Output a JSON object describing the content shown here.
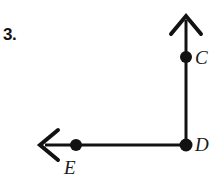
{
  "figure": {
    "problem_number": "3.",
    "stroke_color": "#121212",
    "background_color": "#ffffff",
    "labels": {
      "C": "C",
      "D": "D",
      "E": "E"
    },
    "points": [
      {
        "name": "C",
        "label": "C",
        "x": 186,
        "y": 57,
        "dot_radius": 6
      },
      {
        "name": "D",
        "label": "D",
        "x": 186,
        "y": 145,
        "dot_radius": 6
      },
      {
        "name": "E",
        "label": "E",
        "x": 76,
        "y": 145,
        "dot_radius": 6
      }
    ],
    "rays": [
      {
        "name": "ray-DC-up",
        "from": {
          "x": 186,
          "y": 145
        },
        "to": {
          "x": 186,
          "y": 17
        },
        "direction": "up",
        "arrowhead": true,
        "stroke_width": 3
      },
      {
        "name": "ray-DE-left",
        "from": {
          "x": 186,
          "y": 145
        },
        "to": {
          "x": 42,
          "y": 145
        },
        "direction": "left",
        "arrowhead": true,
        "stroke_width": 3
      }
    ],
    "arrowheads": [
      {
        "name": "arrowhead-up",
        "tip": {
          "x": 186,
          "y": 15
        },
        "left_wing": {
          "x": 172,
          "y": 33
        },
        "right_wing": {
          "x": 200,
          "y": 33
        }
      },
      {
        "name": "arrowhead-left",
        "tip": {
          "x": 40,
          "y": 145
        },
        "top_wing": {
          "x": 57,
          "y": 131
        },
        "bottom_wing": {
          "x": 57,
          "y": 159
        }
      }
    ]
  }
}
